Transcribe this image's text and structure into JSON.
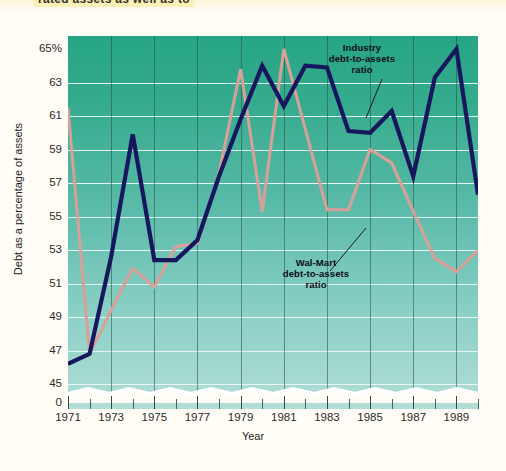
{
  "heading": {
    "text": "rated assets as well as to"
  },
  "chart_data": {
    "type": "line",
    "title": "",
    "xlabel": "Year",
    "ylabel": "Debt as a percentage of assets",
    "x": [
      1971,
      1972,
      1973,
      1974,
      1975,
      1976,
      1977,
      1978,
      1979,
      1980,
      1981,
      1982,
      1983,
      1984,
      1985,
      1986,
      1987,
      1988,
      1989,
      1990
    ],
    "xticks": [
      "1971",
      "1973",
      "1975",
      "1977",
      "1979",
      "1981",
      "1983",
      "1985",
      "1987",
      "1989"
    ],
    "yticks": [
      "65%",
      "63",
      "61",
      "59",
      "57",
      "55",
      "53",
      "51",
      "49",
      "47",
      "45",
      "0"
    ],
    "ylim": [
      44.0,
      65.0
    ],
    "ybreak": "0",
    "grid": true,
    "legend_position": "inline-annotations",
    "series": [
      {
        "name": "Industry debt-to-assets ratio",
        "color": "#17175e",
        "values": [
          46.2,
          46.8,
          52.6,
          59.9,
          52.4,
          52.4,
          53.6,
          57.4,
          60.8,
          64.0,
          61.6,
          64.0,
          63.9,
          60.1,
          60.0,
          61.3,
          57.4,
          63.3,
          65.0,
          56.3
        ]
      },
      {
        "name": "Wal-Mart debt-to-assets ratio",
        "color": "#d9a09a",
        "values": [
          61.5,
          46.8,
          49.4,
          51.9,
          50.8,
          53.2,
          53.4,
          57.6,
          63.8,
          55.3,
          65.0,
          60.2,
          55.4,
          55.4,
          59.0,
          58.2,
          55.3,
          52.5,
          51.7,
          53.0
        ]
      }
    ],
    "annotations": [
      {
        "id": "industry",
        "lines": [
          "Industry",
          "debt-to-assets",
          "ratio"
        ],
        "points_to_year": 1987
      },
      {
        "id": "walmart",
        "lines": [
          "Wal-Mart",
          "debt-to-assets",
          "ratio"
        ],
        "points_to_year": 1985
      }
    ]
  },
  "colors": {
    "plot_bg_top": "#26a584",
    "plot_bg_bottom": "#b2ded7",
    "gridline": "#eef8f6",
    "page_bg": "#fffdf5",
    "industry_line": "#17175e",
    "walmart_line": "#d9a09a"
  }
}
